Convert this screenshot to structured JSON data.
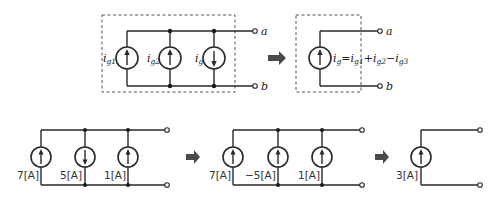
{
  "diagram": {
    "top_left": {
      "sources": [
        {
          "label_main": "i",
          "label_sub": "g1",
          "direction": "up"
        },
        {
          "label_main": "i",
          "label_sub": "g2",
          "direction": "up"
        },
        {
          "label_main": "i",
          "label_sub": "g",
          "direction": "down"
        }
      ],
      "terminals": [
        "a",
        "b"
      ]
    },
    "top_right": {
      "equation": {
        "lhs_main": "i",
        "lhs_sub": "g",
        "eq": "=",
        "t1_main": "i",
        "t1_sub": "g1",
        "op1": "+",
        "t2_main": "i",
        "t2_sub": "g2",
        "op2": "−",
        "t3_main": "i",
        "t3_sub": "g3"
      },
      "terminals": [
        "a",
        "b"
      ]
    },
    "bottom_1": {
      "sources": [
        {
          "label": "7[A]",
          "direction": "up"
        },
        {
          "label": "5[A]",
          "direction": "down"
        },
        {
          "label": "1[A]",
          "direction": "up"
        }
      ]
    },
    "bottom_2": {
      "sources": [
        {
          "label": "7[A]",
          "direction": "up"
        },
        {
          "label": "−5[A]",
          "direction": "up"
        },
        {
          "label": "1[A]",
          "direction": "up"
        }
      ]
    },
    "bottom_3": {
      "sources": [
        {
          "label": "3[A]",
          "direction": "up"
        }
      ]
    },
    "arrows": [
      "right-arrow",
      "right-arrow",
      "right-arrow"
    ]
  }
}
